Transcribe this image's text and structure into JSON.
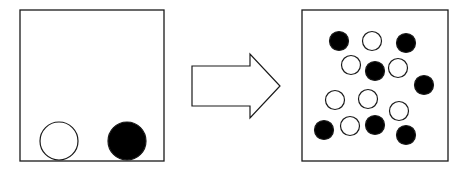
{
  "diagram": {
    "colors": {
      "stroke": "#1a1a1a",
      "filled": "#000000",
      "empty": "#ffffff",
      "background": "#ffffff"
    },
    "before_panel": {
      "particles": [
        {
          "kind": "white"
        },
        {
          "kind": "black"
        }
      ]
    },
    "transition": {
      "icon": "right-arrow-icon"
    },
    "after_panel": {
      "particles": [
        {
          "kind": "black"
        },
        {
          "kind": "white"
        },
        {
          "kind": "black"
        },
        {
          "kind": "white"
        },
        {
          "kind": "black"
        },
        {
          "kind": "white"
        },
        {
          "kind": "black"
        },
        {
          "kind": "white"
        },
        {
          "kind": "white"
        },
        {
          "kind": "white"
        },
        {
          "kind": "black"
        },
        {
          "kind": "white"
        },
        {
          "kind": "black"
        },
        {
          "kind": "black"
        }
      ]
    }
  }
}
